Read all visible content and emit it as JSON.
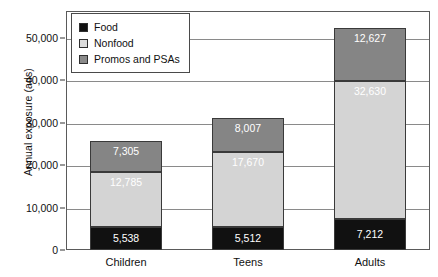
{
  "chart_data": {
    "type": "bar",
    "stacked": true,
    "title": "",
    "xlabel": "",
    "ylabel": "Annual exposure (ads)",
    "categories": [
      "Children",
      "Teens",
      "Adults"
    ],
    "series": [
      {
        "name": "Food",
        "color": "#111111",
        "values": [
          5538,
          5512,
          7212
        ],
        "labels": [
          "5,538",
          "5,512",
          "7,212"
        ]
      },
      {
        "name": "Nonfood",
        "color": "#d4d4d4",
        "values": [
          12785,
          17670,
          32630
        ],
        "labels": [
          "12,785",
          "17,670",
          "32,630"
        ]
      },
      {
        "name": "Promos and PSAs",
        "color": "#858585",
        "values": [
          7305,
          8007,
          12627
        ],
        "labels": [
          "7,305",
          "8,007",
          "12,627"
        ]
      }
    ],
    "totals": [
      25628,
      31189,
      52469
    ],
    "ylim": [
      0,
      56400
    ],
    "yticks": [
      0,
      10000,
      20000,
      30000,
      40000,
      50000
    ],
    "ytick_labels": [
      "0",
      "10,000",
      "20,000",
      "30,000",
      "40,000",
      "50,000"
    ],
    "grid": true,
    "legend_position": "top-left"
  },
  "legend": {
    "items": [
      {
        "label": "Food"
      },
      {
        "label": "Nonfood"
      },
      {
        "label": "Promos and PSAs"
      }
    ]
  }
}
